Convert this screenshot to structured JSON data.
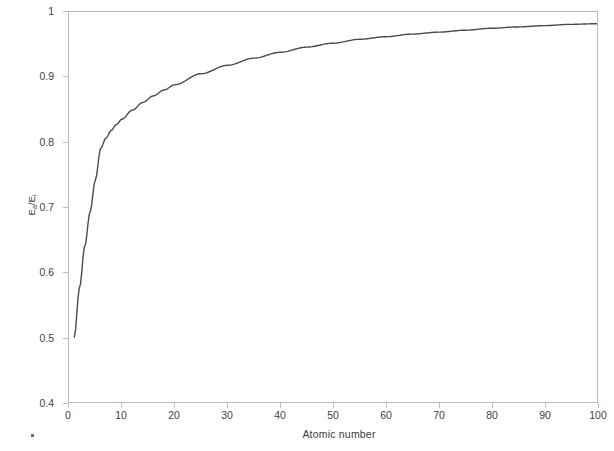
{
  "chart_data": {
    "type": "line",
    "title": "",
    "subtitle": "",
    "xlabel": "Atomic number",
    "ylabel": "Ea/Ei",
    "ylabel_base": "E",
    "ylabel_sub1": "a",
    "ylabel_mid": "/E",
    "ylabel_sub2": "i",
    "xlim": [
      0,
      100
    ],
    "ylim": [
      0.4,
      1
    ],
    "xticks": [
      0,
      10,
      20,
      30,
      40,
      50,
      60,
      70,
      80,
      90,
      100
    ],
    "xtick_labels": [
      "0",
      "10",
      "20",
      "30",
      "40",
      "50",
      "60",
      "70",
      "80",
      "90",
      "100"
    ],
    "yticks": [
      0.4,
      0.5,
      0.6,
      0.7,
      0.8,
      0.9,
      1
    ],
    "ytick_labels": [
      "0.4",
      "0.5",
      "0.6",
      "0.7",
      "0.8",
      "0.9",
      "1"
    ],
    "grid": false,
    "legend": null,
    "legend_position": "none",
    "series": [
      {
        "name": "Ea/Ei vs atomic number",
        "color": "#4a4a4a",
        "line_width": 1.4,
        "x": [
          1,
          2,
          3,
          4,
          5,
          6,
          7,
          8,
          9,
          10,
          12,
          14,
          16,
          18,
          20,
          25,
          30,
          35,
          40,
          45,
          50,
          55,
          60,
          65,
          70,
          75,
          80,
          85,
          90,
          95,
          100
        ],
        "y": [
          0.5,
          0.576,
          0.64,
          0.693,
          0.742,
          0.79,
          0.806,
          0.818,
          0.827,
          0.835,
          0.849,
          0.861,
          0.871,
          0.88,
          0.888,
          0.905,
          0.918,
          0.929,
          0.938,
          0.946,
          0.952,
          0.958,
          0.962,
          0.966,
          0.969,
          0.972,
          0.975,
          0.977,
          0.979,
          0.981,
          0.982
        ]
      }
    ],
    "annotations": []
  },
  "axis_style": {
    "frame_color": "#b9b9b9",
    "tick_color": "#bdbdbd",
    "text_color": "#3f3f3f",
    "curve_color": "#4a4a4a",
    "background": "#ffffff"
  }
}
